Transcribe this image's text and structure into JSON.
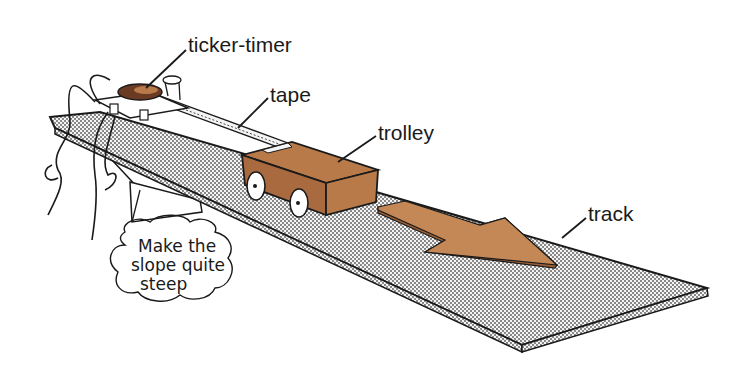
{
  "diagram": {
    "labels": {
      "ticker_timer": "ticker-timer",
      "tape": "tape",
      "trolley": "trolley",
      "track": "track"
    },
    "note": {
      "line1": "Make the",
      "line2": "slope quite",
      "line3": "steep"
    },
    "colors": {
      "trolley": "#b97a4a",
      "trolley_dark": "#9c5f36",
      "arrow": "#c48756",
      "track_dot": "#555555",
      "line": "#1a1a1a",
      "timer_body": "#6b3a22"
    },
    "direction_arrow": "motion-direction-arrow"
  }
}
